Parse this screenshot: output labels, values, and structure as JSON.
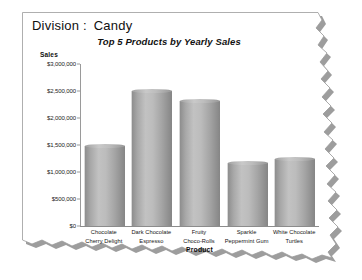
{
  "report": {
    "division_label": "Division :",
    "division_value": "Candy"
  },
  "chart_data": {
    "type": "bar",
    "title": "Top 5 Products by Yearly Sales",
    "xlabel": "Product",
    "ylabel": "Sales",
    "categories": [
      "Chocolate Cherry Delight",
      "Dark Chocolate Espresso",
      "Fruity Choco-Rolls",
      "Sparkle Peppermint Gum",
      "White Chocolate Turtles"
    ],
    "category_lines": [
      [
        "Chocolate",
        "Cherry Delight"
      ],
      [
        "Dark Chocolate",
        "Espresso"
      ],
      [
        "Fruity",
        "Choco-Rolls"
      ],
      [
        "Sparkle",
        "Peppermint Gum"
      ],
      [
        "White Chocolate",
        "Turtles"
      ]
    ],
    "values": [
      1480000,
      2500000,
      2310000,
      1160000,
      1240000
    ],
    "ylim": [
      0,
      3000000
    ],
    "ytick_values": [
      0,
      500000,
      1000000,
      1500000,
      2000000,
      2500000,
      3000000
    ],
    "ytick_labels": [
      "$0",
      "$500,000",
      "$1,000,000",
      "$1,500,000",
      "$2,000,000",
      "$2,500,000",
      "$3,000,000"
    ],
    "grid": false,
    "legend": false,
    "bar_style": "cylinder",
    "bar_color": "#b4b4b4"
  }
}
